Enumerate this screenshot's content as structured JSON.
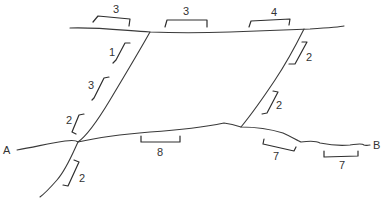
{
  "diagram": {
    "endpoints": {
      "start": "A",
      "end": "B"
    },
    "colors": {
      "stroke": "#3a3a3a",
      "text": "#333333",
      "background": "#ffffff"
    },
    "segments": {
      "top_left": "3",
      "top_middle": "3",
      "top_right": "4",
      "left_diag_upper": "1",
      "left_diag_middle": "3",
      "left_diag_lower": "2",
      "left_diag_below": "2",
      "right_diag_upper": "2",
      "right_diag_lower": "2",
      "bottom_middle": "8",
      "bottom_right_1": "7",
      "bottom_right_2": "7"
    }
  }
}
